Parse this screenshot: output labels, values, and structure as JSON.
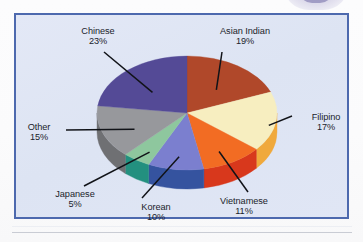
{
  "figure": {
    "frame_border_color": "#4d69ae",
    "frame_background_color": "#dfe5f4",
    "label_text_color": "#1b1d2b",
    "leader_line_color": "#111318"
  },
  "chart_data": {
    "type": "pie",
    "title": "",
    "subtitle": "",
    "xlabel": "",
    "ylabel": "",
    "legend_position": "none",
    "grid": false,
    "three_d": true,
    "start_angle_deg": 0,
    "direction": "clockwise",
    "value_unit": "percent",
    "total": 100,
    "categories": [
      "Asian Indian",
      "Filipino",
      "Vietnamese",
      "Korean",
      "Japanese",
      "Other",
      "Chinese"
    ],
    "values": [
      19,
      17,
      11,
      10,
      5,
      15,
      23
    ],
    "labels": [
      "19%",
      "17%",
      "11%",
      "10%",
      "5%",
      "15%",
      "23%"
    ],
    "colors": [
      "#b0482a",
      "#f7eec0",
      "#f26c23",
      "#7b7fcf",
      "#8ec79e",
      "#97989c",
      "#544a96"
    ],
    "side_colors": [
      "#8e3620",
      "#f0a93c",
      "#d8381c",
      "#35539f",
      "#23907f",
      "#6f7073",
      "#3d3570"
    ],
    "slices": [
      {
        "name": "Asian Indian",
        "value": 19,
        "label": "19%",
        "color": "#b0482a",
        "side_color": "#8e3620"
      },
      {
        "name": "Filipino",
        "value": 17,
        "label": "17%",
        "color": "#f7eec0",
        "side_color": "#f0a93c"
      },
      {
        "name": "Vietnamese",
        "value": 11,
        "label": "11%",
        "color": "#f26c23",
        "side_color": "#d8381c"
      },
      {
        "name": "Korean",
        "value": 10,
        "label": "10%",
        "color": "#7b7fcf",
        "side_color": "#35539f"
      },
      {
        "name": "Japanese",
        "value": 5,
        "label": "5%",
        "color": "#8ec79e",
        "side_color": "#23907f"
      },
      {
        "name": "Other",
        "value": 15,
        "label": "15%",
        "color": "#97989c",
        "side_color": "#6f7073"
      },
      {
        "name": "Chinese",
        "value": 23,
        "label": "23%",
        "color": "#544a96",
        "side_color": "#3d3570"
      }
    ]
  }
}
